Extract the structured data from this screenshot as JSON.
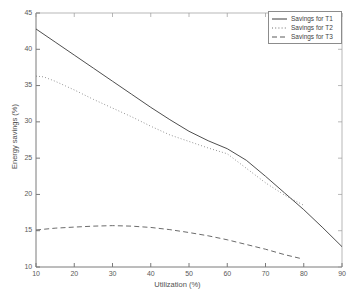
{
  "chart_data": {
    "type": "line",
    "title": "",
    "xlabel": "Utilization (%)",
    "ylabel": "Energy savings (%)",
    "xlim": [
      10,
      90
    ],
    "ylim": [
      10,
      45
    ],
    "xticks": [
      10,
      20,
      30,
      40,
      50,
      60,
      70,
      80,
      90
    ],
    "yticks": [
      10,
      15,
      20,
      25,
      30,
      35,
      40,
      45
    ],
    "grid": false,
    "legend_position": "top-right",
    "series": [
      {
        "name": "Savings for T1",
        "style": "solid",
        "color": "#3a3a3a",
        "x": [
          10,
          15,
          20,
          25,
          30,
          35,
          40,
          45,
          50,
          55,
          60,
          65,
          70,
          75,
          80,
          85,
          90
        ],
        "values": [
          42.8,
          41.0,
          39.2,
          37.4,
          35.6,
          33.8,
          32.0,
          30.3,
          28.7,
          27.4,
          26.3,
          24.7,
          22.5,
          20.2,
          17.9,
          15.4,
          12.8
        ]
      },
      {
        "name": "Savings for T2",
        "style": "dotted",
        "color": "#6e6e6e",
        "x": [
          10,
          12,
          15,
          20,
          25,
          30,
          35,
          40,
          45,
          50,
          55,
          60,
          65,
          70,
          75,
          80
        ],
        "values": [
          36.3,
          36.2,
          35.6,
          34.4,
          33.1,
          31.9,
          30.7,
          29.4,
          28.2,
          27.3,
          26.4,
          25.6,
          23.6,
          21.6,
          19.9,
          18.5
        ]
      },
      {
        "name": "Savings for T3",
        "style": "dashed",
        "color": "#5a5a5a",
        "x": [
          10,
          15,
          20,
          25,
          30,
          35,
          40,
          45,
          50,
          55,
          60,
          65,
          70,
          75,
          79
        ],
        "values": [
          15.1,
          15.35,
          15.5,
          15.63,
          15.7,
          15.63,
          15.45,
          15.15,
          14.75,
          14.3,
          13.75,
          13.1,
          12.45,
          11.7,
          11.2
        ]
      }
    ]
  },
  "legend": {
    "items": [
      {
        "label": "Savings for T1"
      },
      {
        "label": "Savings for T2"
      },
      {
        "label": "Savings for T3"
      }
    ]
  },
  "axes": {
    "x_label": "Utilization (%)",
    "y_label": "Energy savings (%)"
  },
  "colors": {
    "axis": "#6b6b6b",
    "text": "#4a4a4a",
    "background": "#ffffff"
  }
}
